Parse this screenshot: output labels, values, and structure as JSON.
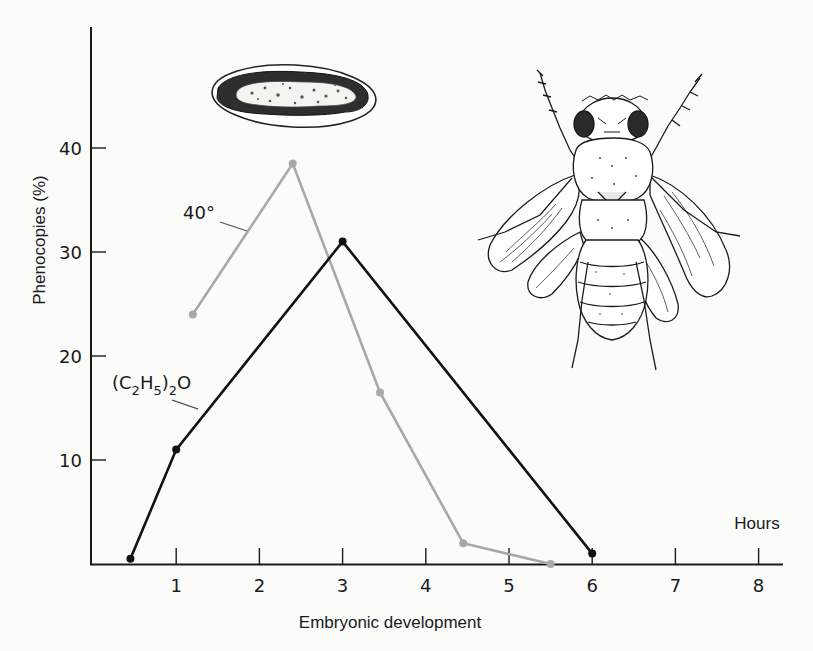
{
  "chart_data": {
    "type": "line",
    "title": "",
    "xlabel": "Embryonic development",
    "x_unit_label": "Hours",
    "ylabel": "Phenocopies (%)",
    "xlim": [
      0,
      8.3
    ],
    "ylim": [
      0,
      46
    ],
    "x_ticks": [
      1,
      2,
      3,
      4,
      5,
      6,
      7,
      8
    ],
    "x_tick_labels": [
      "1",
      "2",
      "3",
      "4",
      "5",
      "6",
      "7",
      "8"
    ],
    "y_ticks": [
      10,
      20,
      30,
      40
    ],
    "y_tick_labels": [
      "10",
      "20",
      "30",
      "40"
    ],
    "grid": false,
    "legend": "inline labels",
    "series": [
      {
        "name": "40°",
        "label_text": "40°",
        "color": "#a8a8a8",
        "x": [
          1.2,
          2.4,
          3.45,
          4.45,
          5.5
        ],
        "values": [
          24,
          38.5,
          16.5,
          2,
          0
        ]
      },
      {
        "name": "(C2H5)2O",
        "label_main": "(C",
        "label_sub1": "2",
        "label_mid": "H",
        "label_sub2": "5",
        "label_close": ")",
        "label_sub3": "2",
        "label_end": "O",
        "color": "#111111",
        "x": [
          0.45,
          1.0,
          3.0,
          6.0
        ],
        "values": [
          0.5,
          11,
          31,
          1
        ]
      }
    ],
    "annotations": [
      "egg-illustration",
      "adult-fly-illustration"
    ]
  }
}
